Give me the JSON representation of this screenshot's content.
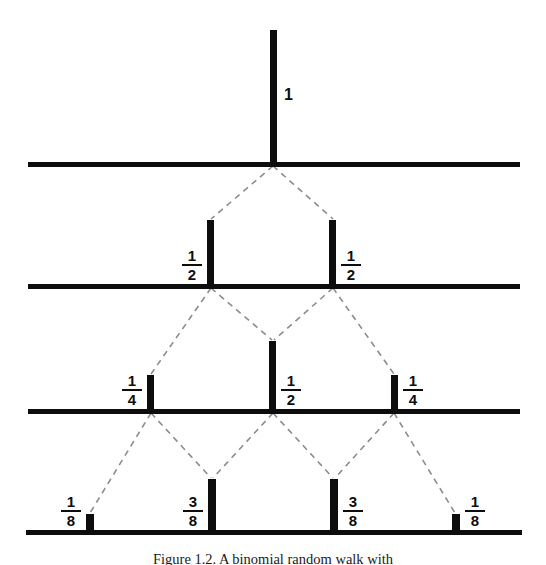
{
  "figure": {
    "caption": "Figure 1.2. A binomial random walk with",
    "background_color": "#ffffff",
    "ink_color": "#0d0d0d",
    "connector_color": "#8c8c8c",
    "baselines": [
      {
        "name": "level-1-baseline",
        "x": 28,
        "y": 162,
        "width": 492
      },
      {
        "name": "level-2-baseline",
        "x": 28,
        "y": 284,
        "width": 492
      },
      {
        "name": "level-3-baseline",
        "x": 28,
        "y": 409,
        "width": 492
      },
      {
        "name": "level-4-baseline",
        "x": 26,
        "y": 530,
        "width": 496
      }
    ],
    "levels": [
      {
        "index": 1,
        "baseline_y": 162,
        "nodes": [
          {
            "label": "1",
            "type": "integer",
            "numerator": "1",
            "denominator": "",
            "x": 270,
            "width": 7,
            "height": 134,
            "label_side": "right"
          }
        ]
      },
      {
        "index": 2,
        "baseline_y": 284,
        "nodes": [
          {
            "label": "1/2",
            "type": "fraction",
            "numerator": "1",
            "denominator": "2",
            "x": 207,
            "width": 7,
            "height": 66,
            "label_side": "left"
          },
          {
            "label": "1/2",
            "type": "fraction",
            "numerator": "1",
            "denominator": "2",
            "x": 329,
            "width": 7,
            "height": 66,
            "label_side": "right"
          }
        ]
      },
      {
        "index": 3,
        "baseline_y": 409,
        "nodes": [
          {
            "label": "1/4",
            "type": "fraction",
            "numerator": "1",
            "denominator": "4",
            "x": 147,
            "width": 7,
            "height": 36,
            "label_side": "left"
          },
          {
            "label": "1/2",
            "type": "fraction",
            "numerator": "1",
            "denominator": "2",
            "x": 269,
            "width": 7,
            "height": 70,
            "label_side": "right"
          },
          {
            "label": "1/4",
            "type": "fraction",
            "numerator": "1",
            "denominator": "4",
            "x": 391,
            "width": 7,
            "height": 36,
            "label_side": "right"
          }
        ]
      },
      {
        "index": 4,
        "baseline_y": 530,
        "nodes": [
          {
            "label": "1/8",
            "type": "fraction",
            "numerator": "1",
            "denominator": "8",
            "x": 86,
            "width": 8,
            "height": 18,
            "label_side": "left"
          },
          {
            "label": "3/8",
            "type": "fraction",
            "numerator": "3",
            "denominator": "8",
            "x": 208,
            "width": 8,
            "height": 53,
            "label_side": "left"
          },
          {
            "label": "3/8",
            "type": "fraction",
            "numerator": "3",
            "denominator": "8",
            "x": 330,
            "width": 8,
            "height": 53,
            "label_side": "right"
          },
          {
            "label": "1/8",
            "type": "fraction",
            "numerator": "1",
            "denominator": "8",
            "x": 452,
            "width": 8,
            "height": 18,
            "label_side": "right"
          }
        ]
      }
    ],
    "connectors": [
      {
        "from_x": 273,
        "from_y": 166,
        "to_x": 211,
        "to_y": 219
      },
      {
        "from_x": 273,
        "from_y": 166,
        "to_x": 333,
        "to_y": 219
      },
      {
        "from_x": 211,
        "from_y": 288,
        "to_x": 151,
        "to_y": 374
      },
      {
        "from_x": 211,
        "from_y": 288,
        "to_x": 272,
        "to_y": 340
      },
      {
        "from_x": 333,
        "from_y": 288,
        "to_x": 274,
        "to_y": 340
      },
      {
        "from_x": 333,
        "from_y": 288,
        "to_x": 394,
        "to_y": 374
      },
      {
        "from_x": 151,
        "from_y": 413,
        "to_x": 90,
        "to_y": 513
      },
      {
        "from_x": 151,
        "from_y": 413,
        "to_x": 211,
        "to_y": 478
      },
      {
        "from_x": 273,
        "from_y": 413,
        "to_x": 213,
        "to_y": 478
      },
      {
        "from_x": 273,
        "from_y": 413,
        "to_x": 333,
        "to_y": 478
      },
      {
        "from_x": 394,
        "from_y": 413,
        "to_x": 335,
        "to_y": 478
      },
      {
        "from_x": 394,
        "from_y": 413,
        "to_x": 455,
        "to_y": 513
      }
    ]
  },
  "chart_data": {
    "type": "bar",
    "xlabel": "",
    "ylabel": "Probability",
    "grid": false,
    "legend": null,
    "series": [
      {
        "name": "Step 0",
        "categories": [
          "0"
        ],
        "values": [
          1
        ],
        "labels": [
          "1"
        ]
      },
      {
        "name": "Step 1",
        "categories": [
          "-1",
          "+1"
        ],
        "values": [
          0.5,
          0.5
        ],
        "labels": [
          "1/2",
          "1/2"
        ]
      },
      {
        "name": "Step 2",
        "categories": [
          "-2",
          "0",
          "+2"
        ],
        "values": [
          0.25,
          0.5,
          0.25
        ],
        "labels": [
          "1/4",
          "1/2",
          "1/4"
        ]
      },
      {
        "name": "Step 3",
        "categories": [
          "-3",
          "-1",
          "+1",
          "+3"
        ],
        "values": [
          0.125,
          0.375,
          0.375,
          0.125
        ],
        "labels": [
          "1/8",
          "3/8",
          "3/8",
          "1/8"
        ]
      }
    ]
  }
}
